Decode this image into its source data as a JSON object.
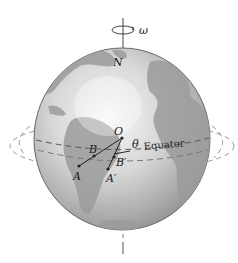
{
  "figure": {
    "labels": {
      "omega": "ω",
      "north": "N",
      "center": "O",
      "angle": "θ",
      "point_b": "B",
      "point_a": "A",
      "point_b_prime": "B′",
      "point_a_prime": "A′",
      "equator": "Equator"
    },
    "colors": {
      "ocean_light": "#f4f4f4",
      "ocean_dark": "#8e8e8e",
      "land": "#9a9a9a",
      "outline": "#555555",
      "dashed": "#666666",
      "text": "#1a1a1a"
    }
  }
}
